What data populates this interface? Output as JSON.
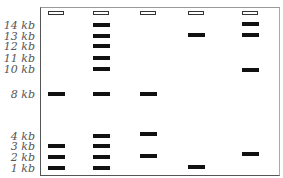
{
  "ladder_labels": [
    {
      "text": "14 kb",
      "y": 20
    },
    {
      "text": "13 kb",
      "y": 31
    },
    {
      "text": "12 kb",
      "y": 41
    },
    {
      "text": "11 kb",
      "y": 53
    },
    {
      "text": "10 kb",
      "y": 64
    },
    {
      "text": "8 kb",
      "y": 89
    },
    {
      "text": "4 kb",
      "y": 131
    },
    {
      "text": "3 kb",
      "y": 141
    },
    {
      "text": "2 kb",
      "y": 152
    },
    {
      "text": "1 kb",
      "y": 163
    }
  ],
  "lanes": [
    {
      "x": 48,
      "bands": [
        94,
        146,
        157,
        168
      ]
    },
    {
      "x": 93,
      "bands": [
        25,
        36,
        46,
        58,
        69,
        94,
        136,
        146,
        157,
        168
      ]
    },
    {
      "x": 140,
      "bands": [
        94,
        134,
        156
      ]
    },
    {
      "x": 188,
      "bands": [
        35,
        167
      ]
    },
    {
      "x": 242,
      "bands": [
        24,
        35,
        70,
        154
      ]
    }
  ],
  "well_y": 13
}
